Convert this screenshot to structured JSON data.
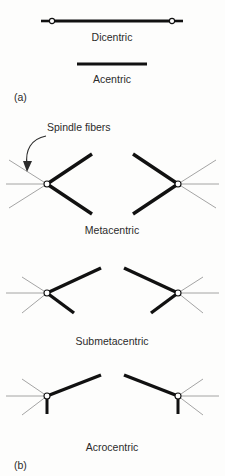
{
  "figure": {
    "title_alt": "Chromosome types and spindle fiber attachment",
    "background_color": "#fdfdfc",
    "chromatid_color": "#111111",
    "spindle_color": "#9a9a9a",
    "centromere_fill": "#ffffff",
    "text_color": "#2b2b2b"
  },
  "panel_a": {
    "label": "(a)",
    "label_x": 14,
    "label_y": 101,
    "items": [
      {
        "name": "dicentric",
        "label": "Dicentric",
        "label_x": 112,
        "label_y": 41,
        "bar": {
          "x1": 52,
          "y1": 21,
          "x2": 172,
          "y2": 21,
          "width": 3.2
        },
        "centromeres": [
          {
            "cx": 52,
            "cy": 21,
            "r": 2.6
          },
          {
            "cx": 172,
            "cy": 21,
            "r": 2.6
          }
        ],
        "stubs": [
          {
            "x1": 41,
            "y1": 21,
            "x2": 49,
            "y2": 21,
            "width": 2.6
          },
          {
            "x1": 175,
            "y1": 21,
            "x2": 183,
            "y2": 21,
            "width": 2.6
          }
        ]
      },
      {
        "name": "acentric",
        "label": "Acentric",
        "label_x": 112,
        "label_y": 83,
        "bar": {
          "x1": 77,
          "y1": 64,
          "x2": 147,
          "y2": 64,
          "width": 3.2
        },
        "centromeres": [],
        "stubs": []
      }
    ]
  },
  "panel_b": {
    "label": "(b)",
    "label_x": 14,
    "label_y": 469,
    "annotation": {
      "label": "Spindle fibers",
      "label_x": 47,
      "label_y": 131,
      "arrow_path": "M 46 136 C 31 139, 25 150, 27 165",
      "arrow_head": "27,172 23,161 32,161"
    },
    "groups": [
      {
        "name": "metacentric",
        "label": "Metacentric",
        "label_x": 112,
        "label_y": 234,
        "left": {
          "centromere": {
            "cx": 47,
            "cy": 184,
            "r": 3.0
          },
          "arms": [
            {
              "x1": 47,
              "y1": 184,
              "x2": 92,
              "y2": 154,
              "width": 3.4
            },
            {
              "x1": 47,
              "y1": 184,
              "x2": 92,
              "y2": 214,
              "width": 3.4
            }
          ],
          "spindles": [
            {
              "x1": 47,
              "y1": 184,
              "x2": 6,
              "y2": 184,
              "width": 0.9
            },
            {
              "x1": 47,
              "y1": 184,
              "x2": 9,
              "y2": 160,
              "width": 0.9
            },
            {
              "x1": 47,
              "y1": 184,
              "x2": 9,
              "y2": 208,
              "width": 0.9
            }
          ]
        },
        "right": {
          "centromere": {
            "cx": 178,
            "cy": 184,
            "r": 3.0
          },
          "arms": [
            {
              "x1": 178,
              "y1": 184,
              "x2": 133,
              "y2": 154,
              "width": 3.4
            },
            {
              "x1": 178,
              "y1": 184,
              "x2": 133,
              "y2": 214,
              "width": 3.4
            }
          ],
          "spindles": [
            {
              "x1": 178,
              "y1": 184,
              "x2": 219,
              "y2": 184,
              "width": 0.9
            },
            {
              "x1": 178,
              "y1": 184,
              "x2": 216,
              "y2": 160,
              "width": 0.9
            },
            {
              "x1": 178,
              "y1": 184,
              "x2": 216,
              "y2": 208,
              "width": 0.9
            }
          ]
        }
      },
      {
        "name": "submetacentric",
        "label": "Submetacentric",
        "label_x": 112,
        "label_y": 345,
        "left": {
          "centromere": {
            "cx": 47,
            "cy": 293,
            "r": 3.0
          },
          "arms": [
            {
              "x1": 47,
              "y1": 293,
              "x2": 101,
              "y2": 268,
              "width": 3.4
            },
            {
              "x1": 47,
              "y1": 293,
              "x2": 74,
              "y2": 313,
              "width": 3.4
            }
          ],
          "spindles": [
            {
              "x1": 47,
              "y1": 293,
              "x2": 6,
              "y2": 293,
              "width": 0.9
            },
            {
              "x1": 47,
              "y1": 293,
              "x2": 22,
              "y2": 277,
              "width": 0.9
            },
            {
              "x1": 47,
              "y1": 293,
              "x2": 22,
              "y2": 313,
              "width": 0.9
            }
          ]
        },
        "right": {
          "centromere": {
            "cx": 178,
            "cy": 293,
            "r": 3.0
          },
          "arms": [
            {
              "x1": 178,
              "y1": 293,
              "x2": 124,
              "y2": 268,
              "width": 3.4
            },
            {
              "x1": 178,
              "y1": 293,
              "x2": 151,
              "y2": 313,
              "width": 3.4
            }
          ],
          "spindles": [
            {
              "x1": 178,
              "y1": 293,
              "x2": 219,
              "y2": 293,
              "width": 0.9
            },
            {
              "x1": 178,
              "y1": 293,
              "x2": 203,
              "y2": 277,
              "width": 0.9
            },
            {
              "x1": 178,
              "y1": 293,
              "x2": 203,
              "y2": 313,
              "width": 0.9
            }
          ]
        }
      },
      {
        "name": "acrocentric",
        "label": "Acrocentric",
        "label_x": 112,
        "label_y": 451,
        "left": {
          "centromere": {
            "cx": 47,
            "cy": 396,
            "r": 3.0
          },
          "arms": [
            {
              "x1": 47,
              "y1": 396,
              "x2": 101,
              "y2": 375,
              "width": 3.4
            },
            {
              "x1": 47,
              "y1": 398,
              "x2": 47,
              "y2": 414,
              "width": 3.0
            }
          ],
          "spindles": [
            {
              "x1": 47,
              "y1": 396,
              "x2": 6,
              "y2": 396,
              "width": 0.9
            },
            {
              "x1": 47,
              "y1": 396,
              "x2": 22,
              "y2": 379,
              "width": 0.9
            },
            {
              "x1": 47,
              "y1": 396,
              "x2": 22,
              "y2": 415,
              "width": 0.9
            }
          ]
        },
        "right": {
          "centromere": {
            "cx": 178,
            "cy": 396,
            "r": 3.0
          },
          "arms": [
            {
              "x1": 178,
              "y1": 396,
              "x2": 124,
              "y2": 375,
              "width": 3.4
            },
            {
              "x1": 178,
              "y1": 398,
              "x2": 178,
              "y2": 414,
              "width": 3.0
            }
          ],
          "spindles": [
            {
              "x1": 178,
              "y1": 396,
              "x2": 219,
              "y2": 396,
              "width": 0.9
            },
            {
              "x1": 178,
              "y1": 396,
              "x2": 203,
              "y2": 379,
              "width": 0.9
            },
            {
              "x1": 178,
              "y1": 396,
              "x2": 203,
              "y2": 415,
              "width": 0.9
            }
          ]
        }
      }
    ]
  }
}
